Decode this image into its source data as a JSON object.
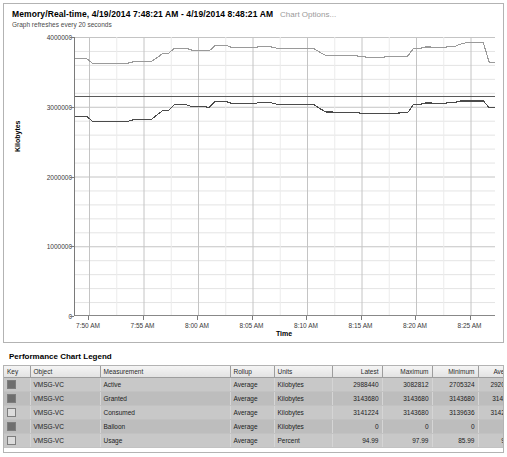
{
  "header": {
    "title": "Memory/Real-time, 4/19/2014 7:48:21 AM - 4/19/2014 8:48:21 AM",
    "options_link": "Chart Options...",
    "refresh_note": "Graph refreshes every 20 seconds"
  },
  "legend": {
    "section_title": "Performance Chart Legend",
    "columns": [
      "Key",
      "Object",
      "Measurement",
      "Rollup",
      "Units",
      "Latest",
      "Maximum",
      "Minimum",
      "Average"
    ],
    "rows": [
      {
        "key_color": "#6e6e6e",
        "object": "VMSG-VC",
        "measurement": "Active",
        "rollup": "Average",
        "units": "Kilobytes",
        "latest": "2988440",
        "maximum": "3082812",
        "minimum": "2705324",
        "average": "2920107."
      },
      {
        "key_color": "#6e6e6e",
        "object": "VMSG-VC",
        "measurement": "Granted",
        "rollup": "Average",
        "units": "Kilobytes",
        "latest": "3143680",
        "maximum": "3143680",
        "minimum": "3143680",
        "average": "3143680"
      },
      {
        "key_color": "#dcdcdc",
        "object": "VMSG-VC",
        "measurement": "Consumed",
        "rollup": "Average",
        "units": "Kilobytes",
        "latest": "3141224",
        "maximum": "3143680",
        "minimum": "3139636",
        "average": "3142858."
      },
      {
        "key_color": "#6e6e6e",
        "object": "VMSG-VC",
        "measurement": "Balloon",
        "rollup": "Average",
        "units": "Kilobytes",
        "latest": "0",
        "maximum": "0",
        "minimum": "0",
        "average": "0"
      },
      {
        "key_color": "#dcdcdc",
        "object": "VMSG-VC",
        "measurement": "Usage",
        "rollup": "Average",
        "units": "Percent",
        "latest": "94.99",
        "maximum": "97.99",
        "minimum": "85.99",
        "average": "92.81"
      }
    ]
  },
  "chart_data": {
    "type": "line",
    "title": "Memory/Real-time, 4/19/2014 7:48:21 AM - 4/19/2014 8:48:21 AM",
    "xlabel": "Time",
    "ylabel": "Kilobytes",
    "ylim": [
      0,
      4000000
    ],
    "yticks": [
      0,
      1000000,
      2000000,
      3000000,
      4000000
    ],
    "ytick_labels": [
      "0",
      "1000000",
      "2000000",
      "3000000",
      "4000000"
    ],
    "xticks": [
      "7:50 AM",
      "7:55 AM",
      "8:00 AM",
      "8:05 AM",
      "8:10 AM",
      "8:15 AM",
      "8:20 AM",
      "8:25 AM"
    ],
    "grid": true,
    "legend_position": "table-below",
    "series": [
      {
        "name": "Usage",
        "color": "#9a9a9a",
        "units": "Percent",
        "scale_note": "plotted on 0-100 percent mapped over full axis height",
        "values": [
          92.2,
          92.2,
          92.2,
          90.6,
          90.6,
          90.6,
          90.6,
          90.6,
          90.6,
          90.6,
          91.1,
          91.1,
          91.1,
          91.1,
          92.5,
          94.0,
          94.0,
          96.0,
          96.0,
          96.0,
          95.3,
          95.3,
          95.3,
          95.0,
          96.9,
          96.9,
          96.9,
          96.2,
          96.2,
          96.2,
          96.2,
          96.3,
          96.7,
          96.7,
          96.3,
          95.8,
          95.8,
          96.0,
          96.0,
          96.0,
          95.8,
          95.8,
          94.5,
          93.4,
          93.4,
          93.3,
          93.3,
          93.3,
          93.3,
          93.0,
          92.8,
          92.8,
          92.8,
          92.8,
          93.0,
          93.0,
          93.1,
          93.1,
          95.8,
          95.8,
          96.4,
          96.4,
          96.2,
          96.2,
          96.5,
          96.5,
          97.4,
          97.9,
          97.9,
          97.9,
          97.9,
          91.0,
          91.0
        ]
      },
      {
        "name": "Granted",
        "color": "#5a5a5a",
        "units": "Kilobytes",
        "values": [
          3143680,
          3143680,
          3143680,
          3143680,
          3143680,
          3143680,
          3143680,
          3143680,
          3143680,
          3143680,
          3143680,
          3143680,
          3143680,
          3143680,
          3143680,
          3143680,
          3143680,
          3143680,
          3143680,
          3143680,
          3143680,
          3143680,
          3143680,
          3143680,
          3143680,
          3143680,
          3143680,
          3143680,
          3143680,
          3143680,
          3143680,
          3143680,
          3143680,
          3143680,
          3143680,
          3143680,
          3143680,
          3143680,
          3143680,
          3143680,
          3143680,
          3143680,
          3143680,
          3143680,
          3143680,
          3143680,
          3143680,
          3143680,
          3143680,
          3143680,
          3143680,
          3143680,
          3143680,
          3143680,
          3143680,
          3143680,
          3143680,
          3143680,
          3143680,
          3143680,
          3143680,
          3143680,
          3143680,
          3143680,
          3143680,
          3143680,
          3143680,
          3143680,
          3143680,
          3143680,
          3143680,
          3143680,
          3143680
        ]
      },
      {
        "name": "Active",
        "color": "#4a4a4a",
        "units": "Kilobytes",
        "values": [
          2866000,
          2866000,
          2866000,
          2790000,
          2790000,
          2790000,
          2790000,
          2790000,
          2790000,
          2790000,
          2812000,
          2812000,
          2812000,
          2812000,
          2880000,
          2942000,
          2942000,
          3030000,
          3030000,
          3030000,
          3002000,
          3002000,
          3002000,
          2990000,
          3072000,
          3072000,
          3072000,
          3045000,
          3045000,
          3045000,
          3045000,
          3050000,
          3066000,
          3066000,
          3050000,
          3028000,
          3028000,
          3036000,
          3036000,
          3036000,
          3028000,
          3028000,
          2972000,
          2925000,
          2925000,
          2920000,
          2920000,
          2920000,
          2920000,
          2908000,
          2900000,
          2900000,
          2900000,
          2900000,
          2908000,
          2908000,
          2912000,
          2912000,
          3028000,
          3028000,
          3054000,
          3054000,
          3045000,
          3045000,
          3058000,
          3058000,
          3082812,
          3082812,
          3082812,
          3082812,
          3082812,
          2988440,
          2988440
        ]
      },
      {
        "name": "Balloon",
        "color": "#888888",
        "units": "Kilobytes",
        "values": [
          0,
          0,
          0,
          0,
          0,
          0,
          0,
          0,
          0,
          0,
          0,
          0,
          0,
          0,
          0,
          0,
          0,
          0,
          0,
          0,
          0,
          0,
          0,
          0,
          0,
          0,
          0,
          0,
          0,
          0,
          0,
          0,
          0,
          0,
          0,
          0,
          0,
          0,
          0,
          0,
          0,
          0,
          0,
          0,
          0,
          0,
          0,
          0,
          0,
          0,
          0,
          0,
          0,
          0,
          0,
          0,
          0,
          0,
          0,
          0,
          0,
          0,
          0,
          0,
          0,
          0,
          0,
          0,
          0,
          0,
          0,
          0,
          0
        ]
      }
    ]
  }
}
